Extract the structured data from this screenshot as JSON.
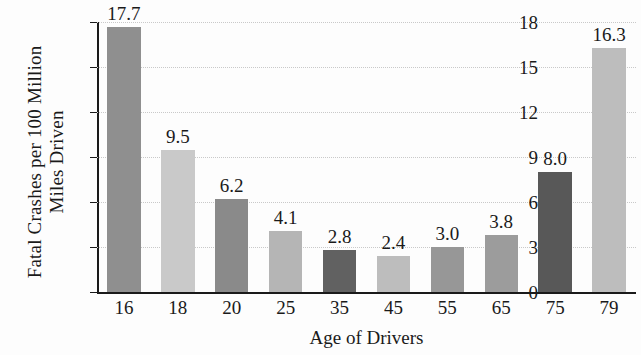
{
  "chart_data": {
    "type": "bar",
    "title": "",
    "xlabel": "Age of Drivers",
    "ylabel_line1": "Fatal Crashes per 100 Million",
    "ylabel_line2": "Miles Driven",
    "categories": [
      "16",
      "18",
      "20",
      "25",
      "35",
      "45",
      "55",
      "65",
      "75",
      "79"
    ],
    "values": [
      17.7,
      9.5,
      6.2,
      4.1,
      2.8,
      2.4,
      3.0,
      3.8,
      8.0,
      16.3
    ],
    "value_labels": [
      "17.7",
      "9.5",
      "6.2",
      "4.1",
      "2.8",
      "2.4",
      "3.0",
      "3.8",
      "8.0",
      "16.3"
    ],
    "bar_colors": [
      "#8f8f8f",
      "#c9c9c9",
      "#8a8a8a",
      "#b5b5b5",
      "#616161",
      "#bdbdbd",
      "#979797",
      "#9c9c9c",
      "#585858",
      "#bdbdbd"
    ],
    "ylim": [
      0,
      18
    ],
    "yticks": [
      0,
      3,
      6,
      9,
      12,
      15,
      18
    ],
    "ytick_labels": [
      "0",
      "3",
      "6",
      "9",
      "12",
      "15",
      "18"
    ],
    "grid": true,
    "gridline_color": "#c9c9c9",
    "axis_color": "#1a1a1a",
    "legend": "none"
  }
}
